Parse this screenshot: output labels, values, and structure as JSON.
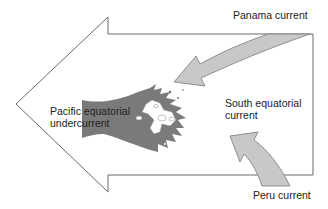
{
  "diagram": {
    "colors": {
      "outline": "#666666",
      "big_arrow_fill": "#ffffff",
      "undercurrent_fill": "#7a7a7a",
      "side_current_fill": "#c8c8c8",
      "island_fill": "#ffffff",
      "text": "#222222"
    },
    "labels": {
      "panama": "Panama current",
      "south_line1": "South equatorial",
      "south_line2": "current",
      "pacific_line1": "Pacific equatorial",
      "pacific_line2": "undercurrent",
      "peru": "Peru current"
    },
    "elements": [
      {
        "id": "south-equatorial-current-arrow",
        "shape": "large outlined arrow",
        "direction": "west"
      },
      {
        "id": "pacific-equatorial-undercurrent",
        "shape": "dark gray fan-shaped current",
        "direction": "east"
      },
      {
        "id": "panama-current-arrow",
        "shape": "light gray curved arrow",
        "direction": "southwest"
      },
      {
        "id": "peru-current-arrow",
        "shape": "light gray curved arrow",
        "direction": "northwest"
      },
      {
        "id": "galapagos-islands",
        "shape": "white island cluster"
      }
    ]
  }
}
